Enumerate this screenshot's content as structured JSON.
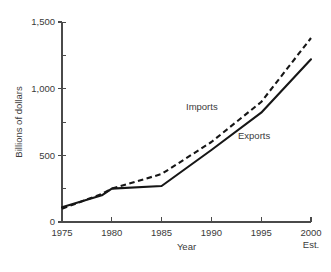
{
  "chart_data": {
    "type": "line",
    "title": "",
    "xlabel": "Year",
    "ylabel": "Billions of dollars",
    "x": [
      1975,
      1979,
      1980,
      1985,
      1990,
      1995,
      2000
    ],
    "xlim": [
      1975,
      2000
    ],
    "ylim": [
      0,
      1500
    ],
    "grid": false,
    "legend_position": "inline-annotation",
    "x_tick_labels": [
      "1975",
      "1980",
      "1985",
      "1990",
      "1995",
      "2000"
    ],
    "x_tick_values": [
      1975,
      1980,
      1985,
      1990,
      1995,
      2000
    ],
    "x_axis_note": "Est.",
    "y_tick_labels": [
      "0",
      "500",
      "1,000",
      "1,500"
    ],
    "y_tick_values": [
      0,
      500,
      1000,
      1500
    ],
    "y_minor_tick_values": [
      250,
      750,
      1250
    ],
    "series": [
      {
        "name": "Imports",
        "style": "dashed",
        "color": "#161616",
        "label_text": "Imports",
        "values": [
          100,
          210,
          250,
          360,
          600,
          900,
          1380
        ]
      },
      {
        "name": "Exports",
        "style": "solid",
        "color": "#161616",
        "label_text": "Exports",
        "values": [
          110,
          200,
          250,
          270,
          540,
          820,
          1220
        ]
      }
    ]
  },
  "annotations": {
    "imports_label": "Imports",
    "exports_label": "Exports"
  },
  "axes": {
    "y_title": "Billions of dollars",
    "x_title": "Year",
    "est_note": "Est."
  },
  "colors": {
    "background": "#ffffff",
    "ink": "#161616",
    "axis": "#4a4a4a",
    "text": "#3a3a3a"
  }
}
